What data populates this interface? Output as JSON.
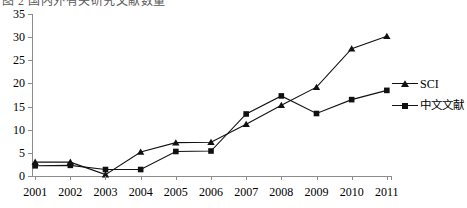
{
  "top_cut_text": "图 2 国内外有关研究文献数量",
  "legend": {
    "position": "right",
    "items": [
      {
        "label": "SCI",
        "marker": "triangle-marker",
        "cjk": false
      },
      {
        "label": "中文文献",
        "marker": "square-marker",
        "cjk": true
      }
    ]
  },
  "axis": {
    "y_ticks": [
      "0",
      "5",
      "10",
      "15",
      "20",
      "25",
      "30",
      "35"
    ],
    "x_ticks": [
      "2001",
      "2002",
      "2003",
      "2004",
      "2005",
      "2006",
      "2007",
      "2008",
      "2009",
      "2010",
      "2011"
    ]
  },
  "colors": {
    "line": "#111111",
    "axis": "#8c8c8c",
    "background": "#ffffff"
  },
  "chart_data": {
    "type": "line",
    "title": "",
    "xlabel": "",
    "ylabel": "",
    "categories": [
      "2001",
      "2002",
      "2003",
      "2004",
      "2005",
      "2006",
      "2007",
      "2008",
      "2009",
      "2010",
      "2011"
    ],
    "ylim": [
      0,
      35
    ],
    "ytick_step": 5,
    "grid": false,
    "legend_position": "right",
    "series": [
      {
        "name": "SCI",
        "marker": "triangle",
        "values": [
          3.0,
          3.0,
          0.3,
          5.2,
          7.2,
          7.3,
          11.2,
          15.3,
          19.2,
          27.5,
          30.2
        ]
      },
      {
        "name": "中文文献",
        "marker": "square",
        "values": [
          2.2,
          2.3,
          1.4,
          1.4,
          5.3,
          5.4,
          13.4,
          17.3,
          13.5,
          16.5,
          18.5
        ]
      }
    ]
  }
}
